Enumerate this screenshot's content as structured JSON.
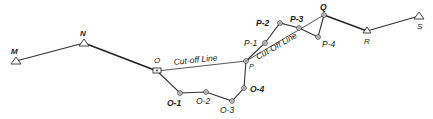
{
  "diagram": {
    "type": "survey traverse with cut-off lines",
    "stations": {
      "M": {
        "label": "M",
        "x": 16,
        "y": 61,
        "kind": "triangle"
      },
      "N": {
        "label": "N",
        "x": 84,
        "y": 43,
        "kind": "triangle"
      },
      "O": {
        "label": "O",
        "x": 157,
        "y": 71,
        "kind": "point"
      },
      "O1": {
        "label": "O-1",
        "x": 180,
        "y": 93,
        "kind": "point"
      },
      "O2": {
        "label": "O-2",
        "x": 206,
        "y": 92,
        "kind": "point"
      },
      "O3": {
        "label": "O-3",
        "x": 232,
        "y": 101,
        "kind": "point"
      },
      "O4": {
        "label": "O-4",
        "x": 244,
        "y": 88,
        "kind": "point"
      },
      "P": {
        "label": "P",
        "x": 246,
        "y": 61,
        "kind": "point"
      },
      "P1": {
        "label": "P-1",
        "x": 265,
        "y": 43,
        "kind": "point"
      },
      "P2": {
        "label": "P-2",
        "x": 280,
        "y": 23,
        "kind": "point"
      },
      "P3": {
        "label": "P-3",
        "x": 299,
        "y": 28,
        "kind": "point"
      },
      "P4": {
        "label": "P-4",
        "x": 318,
        "y": 37,
        "kind": "point"
      },
      "Q": {
        "label": "Q",
        "x": 324,
        "y": 15,
        "kind": "point"
      },
      "R": {
        "label": "R",
        "x": 367,
        "y": 31,
        "kind": "triangle"
      },
      "S": {
        "label": "S",
        "x": 419,
        "y": 16,
        "kind": "triangle"
      }
    },
    "annotations": {
      "cutoff_1": "Cut-off Line",
      "cutoff_2": "Cut-Off Line"
    }
  }
}
